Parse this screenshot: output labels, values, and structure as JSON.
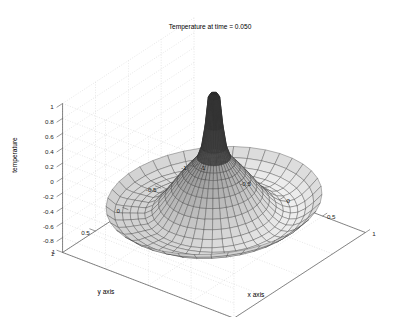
{
  "figure": {
    "background_color": "#ffffff",
    "title": "Temperature at time = 0.050"
  },
  "chart_data": {
    "type": "surface",
    "title": "Temperature at time = 0.050",
    "xlabel": "x axis",
    "ylabel": "y axis",
    "zlabel": "temperature",
    "xlim": [
      -1,
      1
    ],
    "ylim": [
      -1,
      1
    ],
    "zlim": [
      -1,
      1
    ],
    "xticks": [
      -1,
      -0.5,
      0,
      0.5,
      1
    ],
    "xticklabels": [
      "-1",
      "-0.5",
      "0",
      "0.5",
      "1"
    ],
    "yticks": [
      -1,
      -0.5,
      0,
      0.5,
      1
    ],
    "yticklabels": [
      "-1",
      "-0.5",
      "0",
      "0.5",
      "1"
    ],
    "zticks": [
      -0.8,
      -0.6,
      -0.4,
      -0.2,
      0,
      0.2,
      0.4,
      0.6,
      0.8,
      1
    ],
    "zticklabels": [
      "-0.8",
      "-0.6",
      "-0.4",
      "-0.2",
      "0",
      "0.2",
      "0.4",
      "0.6",
      "0.8",
      "1"
    ],
    "grid": true,
    "grid_style": "dotted",
    "grid_color": "#cccccc",
    "mesh": {
      "domain": "unit-disk-polar",
      "radial_divisions": 20,
      "angular_divisions": 40,
      "edge_color": "#333333",
      "face_colormap": "gray",
      "face_color_light": "#e8e8e8",
      "face_color_dark": "#1a1a1a"
    },
    "surface_model": {
      "description": "Axisymmetric Bessel-like heat mode on unit disk with sharp central spike",
      "peak_value": 1.0,
      "rim_value": -0.35,
      "spike_radius": 0.12,
      "skirt_min": -0.55
    },
    "view": {
      "azimuth_deg": -37.5,
      "elevation_deg": 30,
      "projection": "orthographic"
    },
    "axis_colors": {
      "axis_line": "#555555",
      "tick_text": "#222222",
      "title_text": "#000000"
    }
  },
  "axes": {
    "x_label": "x axis",
    "y_label": "y axis",
    "z_label": "temperature"
  }
}
